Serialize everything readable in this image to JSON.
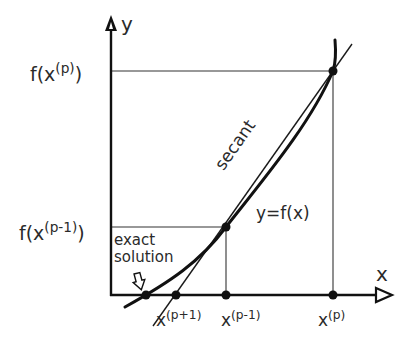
{
  "diagram": {
    "axes": {
      "x_label": "x",
      "y_label": "y"
    },
    "y_ticks": [
      {
        "prefix": "f(x",
        "sup": "(p)",
        "suffix": ")"
      },
      {
        "prefix": "f(x",
        "sup": "(p-1)",
        "suffix": ")"
      }
    ],
    "x_ticks": [
      {
        "base": "x",
        "sup": "(p+1)"
      },
      {
        "base": "x",
        "sup": "(p-1)"
      },
      {
        "base": "x",
        "sup": "(p)"
      }
    ],
    "annotations": {
      "secant": "secant",
      "curve": "y=f(x)",
      "exact_line1": "exact",
      "exact_line2": "solution"
    },
    "colors": {
      "ink": "#1a1a1a",
      "background": "#ffffff"
    },
    "points": {
      "p": [
        333,
        71
      ],
      "p_minus_1": [
        226,
        227
      ],
      "exact": [
        146,
        295
      ],
      "p_plus_1": [
        176,
        295
      ],
      "x_p_foot": [
        333,
        295
      ],
      "x_pm1_foot": [
        226,
        295
      ]
    }
  }
}
